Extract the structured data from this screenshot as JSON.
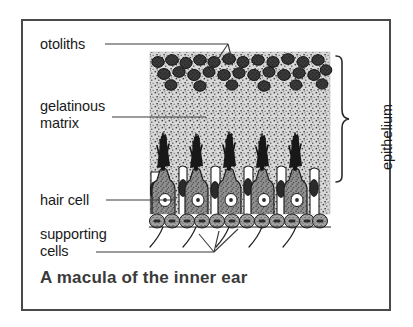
{
  "figure": {
    "title": "A macula of the inner ear",
    "frame": {
      "x": 21,
      "y": 19,
      "width": 370,
      "height": 292,
      "border_color": "#4a4a4a"
    }
  },
  "labels": {
    "otoliths": "otoliths",
    "gelatinous_matrix_line1": "gelatinous",
    "gelatinous_matrix_line2": "matrix",
    "hair_cell": "hair cell",
    "supporting_cells_line1": "supporting",
    "supporting_cells_line2": "cells",
    "epithelium": "epithelium"
  },
  "colors": {
    "ink": "#1a1a1a",
    "title": "#3a3a3a",
    "frame_border": "#4a4a4a",
    "matrix_fill": "#d8d8d8",
    "matrix_stipple": "#3c3c3c",
    "otolith_fill": "#3a3a3a",
    "otolith_stroke": "#161616",
    "hair_cell_fill": "#8a8a8a",
    "hair_cell_stroke": "#1f1f1f",
    "supporting_cell_fill": "#ffffff",
    "supporting_cell_stroke": "#1f1f1f",
    "nucleus_fill": "#2b2b2b",
    "hair_cell_nucleus_fill": "#ffffff",
    "stereocilia": "#141414",
    "basal_cell_fill": "#9a9a9a",
    "nerve_fiber": "#1f1f1f",
    "leader_line": "#3a3a3a"
  },
  "diagram": {
    "type": "labeled-biological-cross-section",
    "subject": "macula of the inner ear",
    "matrix_region": {
      "x": 150,
      "y": 52,
      "width": 180,
      "height": 160
    },
    "otolith_layer": {
      "rows": 2,
      "count": 32,
      "y_top": 56,
      "y_bottom": 84
    },
    "hair_cells": {
      "count": 5,
      "x_positions": [
        163,
        196,
        229,
        262,
        295
      ],
      "top_y": 168,
      "bottom_y": 215
    },
    "supporting_cells": {
      "count": 6
    },
    "basal_cell_row": {
      "count": 13,
      "y": 216
    },
    "nerve_fibers": {
      "count": 5
    },
    "brace": {
      "label": "epithelium",
      "x": 338,
      "y_top": 56,
      "y_bottom": 224
    },
    "leaders": [
      {
        "label": "otoliths",
        "from_x": 104,
        "from_y": 43,
        "to_x": 222,
        "forks": 2
      },
      {
        "label": "gelatinous matrix",
        "from_x": 112,
        "from_y": 116,
        "to_x": 205,
        "forks": 0
      },
      {
        "label": "hair cell",
        "from_x": 106,
        "from_y": 200,
        "to_x": 176,
        "forks": 0
      },
      {
        "label": "supporting cells",
        "from_x": 96,
        "from_y": 252,
        "to_x": 212,
        "forks": 3
      }
    ]
  }
}
